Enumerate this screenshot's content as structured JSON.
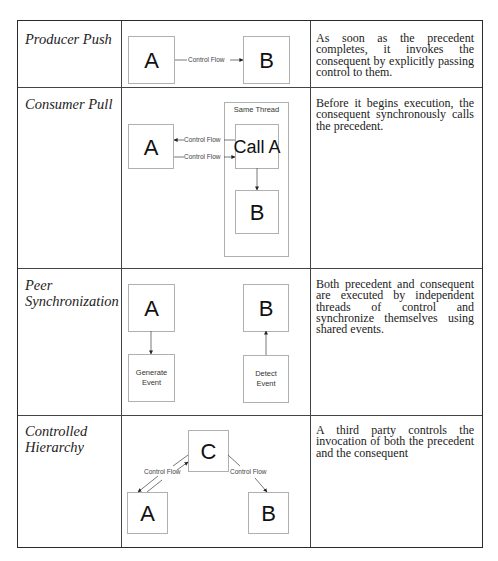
{
  "rows": [
    {
      "name": "Producer Push",
      "description": "As soon as the precedent completes, it invokes the consequent by explicitly passing control to them.",
      "diagram": {
        "nodes": [
          "A",
          "B"
        ],
        "edges": [
          {
            "from": "A",
            "to": "B",
            "label": "Control Flow"
          }
        ]
      }
    },
    {
      "name": "Consumer Pull",
      "description": "Before it begins execution, the consequent synchronously calls the precedent.",
      "diagram": {
        "container_label": "Same Thread",
        "nodes": [
          "A",
          "Call A",
          "B"
        ],
        "edges": [
          {
            "from": "Call A",
            "to": "A",
            "label": "Control Flow"
          },
          {
            "from": "A",
            "to": "Call A",
            "label": "Control Flow"
          },
          {
            "from": "Call A",
            "to": "B",
            "label": ""
          }
        ]
      }
    },
    {
      "name_line1": "Peer",
      "name_line2": "Synchronization",
      "description": "Both precedent and consequent are executed by independent threads of control and synchronize themselves using shared events.",
      "diagram": {
        "nodes": [
          "A",
          "B"
        ],
        "event_nodes": [
          {
            "line1": "Generate",
            "line2": "Event"
          },
          {
            "line1": "Detect",
            "line2": "Event"
          }
        ],
        "edges": [
          {
            "from": "A",
            "to": "Generate Event"
          },
          {
            "from": "Detect Event",
            "to": "B"
          }
        ]
      }
    },
    {
      "name_line1": "Controlled",
      "name_line2": "Hierarchy",
      "description": "A third party controls the invocation of both the precedent and the consequent",
      "diagram": {
        "nodes": [
          "C",
          "A",
          "B"
        ],
        "edges": [
          {
            "from": "C",
            "to": "A",
            "label": "Control Flow"
          },
          {
            "from": "A",
            "to": "C",
            "label": ""
          },
          {
            "from": "C",
            "to": "B",
            "label": "Control Flow"
          }
        ]
      }
    }
  ]
}
